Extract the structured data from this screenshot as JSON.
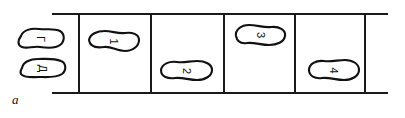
{
  "figure": {
    "panel_letter": "a",
    "type": "schematic-diagram",
    "background_color": "#ffffff",
    "line_color": "#1a1a1a",
    "blob_stroke_color": "#111111",
    "blob_fill_color": "#ffffff"
  },
  "frame": {
    "rail_top_label": "top-rail",
    "rail_bottom_label": "bottom-rail",
    "divider_count": 5,
    "compartment_count": 4
  },
  "blobs": [
    {
      "id": "g",
      "label": "Г",
      "position": "outside-left-upper",
      "rotation_deg": 90
    },
    {
      "id": "d",
      "label": "Д",
      "position": "outside-left-lower",
      "rotation_deg": 90
    },
    {
      "id": "1",
      "label": "1",
      "position": "compartment-1",
      "rotation_deg": 90
    },
    {
      "id": "2",
      "label": "2",
      "position": "compartment-2",
      "rotation_deg": 90
    },
    {
      "id": "3",
      "label": "3",
      "position": "compartment-3",
      "rotation_deg": 90
    },
    {
      "id": "4",
      "label": "4",
      "position": "compartment-4",
      "rotation_deg": 90
    }
  ]
}
